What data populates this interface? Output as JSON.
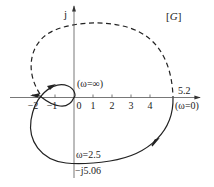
{
  "diagram": {
    "title": "[G]",
    "title_parts": {
      "open": "[",
      "italic": "G",
      "close": "]"
    },
    "axis_imag_label": "j",
    "x_ticks": [
      {
        "value": -2,
        "label": "−2"
      },
      {
        "value": -1,
        "label": "−1"
      },
      {
        "value": 0,
        "label": "0"
      },
      {
        "value": 1,
        "label": "1"
      },
      {
        "value": 2,
        "label": "2"
      },
      {
        "value": 3,
        "label": "3"
      },
      {
        "value": 4,
        "label": "4"
      }
    ],
    "annotations": {
      "omega_inf": "(ω=∞)",
      "real_intercept": "5.2",
      "omega_zero": "(ω=0)",
      "omega_2_5": "ω=2.5",
      "imag_intercept": "−j5.06"
    },
    "colors": {
      "curve": "#222222",
      "axis": "#555555",
      "background": "#ffffff"
    },
    "curves": {
      "solid_description": "Nyquist plot of G(jω) from ω=0 (5.2 on real axis) through −j5.06 at ω=2.5, looping around −1 to origin at ω=∞",
      "dashed_description": "mirror image for negative frequencies"
    }
  }
}
